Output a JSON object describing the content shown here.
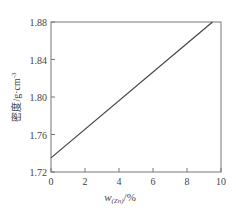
{
  "chart_data": {
    "type": "line",
    "title": "",
    "xlabel": "w(Zn)/%",
    "xlabel_main": "w",
    "xlabel_sub": "(Zn)",
    "xlabel_unit": "/%",
    "ylabel": "密度/g·cm⁻³",
    "ylabel_main": "密度/g·cm",
    "ylabel_sup": "-3",
    "xlim": [
      0,
      10
    ],
    "ylim": [
      1.72,
      1.88
    ],
    "xticks": [
      "0",
      "2",
      "4",
      "6",
      "8",
      "10"
    ],
    "yticks": [
      "1.72",
      "1.76",
      "1.80",
      "1.84",
      "1.88"
    ],
    "grid": false,
    "legend": null,
    "series": [
      {
        "name": "density",
        "x": [
          0,
          9.5
        ],
        "y": [
          1.735,
          1.88
        ]
      }
    ]
  }
}
